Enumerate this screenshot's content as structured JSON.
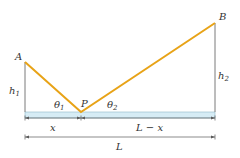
{
  "diagram": {
    "points": {
      "A": {
        "label": "A",
        "x": 25,
        "y": 62
      },
      "B": {
        "label": "B",
        "x": 215,
        "y": 23
      },
      "P": {
        "label": "P",
        "x": 81,
        "y": 112
      }
    },
    "heights": {
      "h1": {
        "label": "h",
        "sub": "1"
      },
      "h2": {
        "label": "h",
        "sub": "2"
      }
    },
    "angles": {
      "theta1": {
        "label": "θ",
        "sub": "1"
      },
      "theta2": {
        "label": "θ",
        "sub": "2"
      }
    },
    "dimensions": {
      "x": "x",
      "l_minus_x": "L − x",
      "L": "L"
    },
    "colors": {
      "path": "#e8a317",
      "ground": "#d6ecf5",
      "ground_edge": "#8fb8c8",
      "line": "#7a7a7a",
      "text": "#333333"
    }
  }
}
